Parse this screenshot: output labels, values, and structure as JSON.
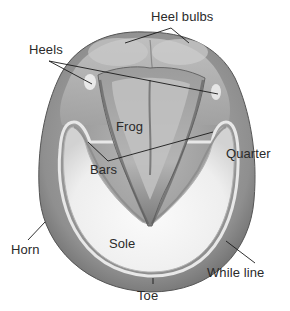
{
  "diagram": {
    "labels": [
      {
        "id": "heel-bulbs",
        "text": "Heel bulbs",
        "x": 151,
        "y": 10
      },
      {
        "id": "heels",
        "text": "Heels",
        "x": 29,
        "y": 43
      },
      {
        "id": "frog",
        "text": "Frog",
        "x": 116,
        "y": 120
      },
      {
        "id": "quarter",
        "text": "Quarter",
        "x": 226,
        "y": 147
      },
      {
        "id": "bars",
        "text": "Bars",
        "x": 90,
        "y": 163
      },
      {
        "id": "horn",
        "text": "Horn",
        "x": 11,
        "y": 243
      },
      {
        "id": "sole",
        "text": "Sole",
        "x": 109,
        "y": 237
      },
      {
        "id": "while-line",
        "text": "While line",
        "x": 207,
        "y": 266
      },
      {
        "id": "toe",
        "text": "Toe",
        "x": 137,
        "y": 289
      }
    ],
    "colors": {
      "text": "#2a2a2a",
      "leader_line": "#1a1a1a",
      "outer_wall": "#8c8c8c",
      "wall_dark": "#6e6e6e",
      "sole": "#f2f2f2",
      "frog": "#a8a8a8",
      "frog_dark": "#6a6a6a",
      "heel_area": "#b9b9b9",
      "background": "#ffffff"
    }
  }
}
